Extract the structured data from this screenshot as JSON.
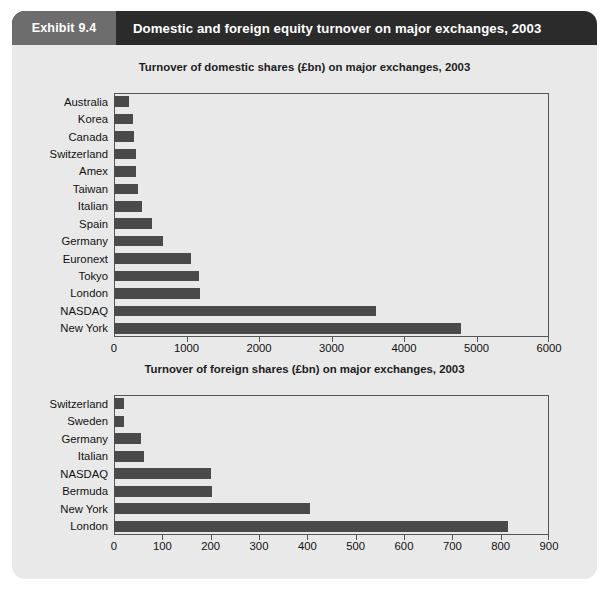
{
  "header": {
    "exhibit_label": "Exhibit 9.4",
    "title": "Domestic and foreign equity turnover on major exchanges, 2003"
  },
  "chart_data": [
    {
      "type": "bar",
      "orientation": "horizontal",
      "title": "Turnover of domestic shares (£bn) on major exchanges, 2003",
      "xlabel": "",
      "ylabel": "",
      "xlim": [
        0,
        6000
      ],
      "xticks": [
        0,
        1000,
        2000,
        3000,
        4000,
        5000,
        6000
      ],
      "xtick_labels": [
        "0",
        "1000",
        "2000",
        "3000",
        "4000",
        "5000",
        "6000"
      ],
      "grid": false,
      "legend": "none",
      "categories": [
        "Australia",
        "Korea",
        "Canada",
        "Switzerland",
        "Amex",
        "Taiwan",
        "Italian",
        "Spain",
        "Germany",
        "Euronext",
        "Tokyo",
        "London",
        "NASDAQ",
        "New York"
      ],
      "values": [
        205,
        265,
        270,
        300,
        310,
        325,
        390,
        530,
        670,
        1060,
        1170,
        1190,
        3620,
        4780
      ],
      "bar_color": "#4a4a4a"
    },
    {
      "type": "bar",
      "orientation": "horizontal",
      "title": "Turnover of foreign shares (£bn) on major exchanges, 2003",
      "xlabel": "",
      "ylabel": "",
      "xlim": [
        0,
        900
      ],
      "xticks": [
        0,
        100,
        200,
        300,
        400,
        500,
        600,
        700,
        800,
        900
      ],
      "xtick_labels": [
        "0",
        "100",
        "200",
        "300",
        "400",
        "500",
        "600",
        "700",
        "800",
        "900"
      ],
      "grid": false,
      "legend": "none",
      "categories": [
        "Switzerland",
        "Sweden",
        "Germany",
        "Italian",
        "NASDAQ",
        "Bermuda",
        "New York",
        "London"
      ],
      "values": [
        21,
        21,
        55,
        63,
        200,
        203,
        405,
        815
      ],
      "bar_color": "#4a4a4a"
    }
  ],
  "colors": {
    "card_background": "#e9e9e9",
    "header_dark": "#2b2b2b",
    "header_tag": "#6d6d6d",
    "bar": "#4a4a4a",
    "frame": "#555555",
    "page": "#ffffff"
  }
}
